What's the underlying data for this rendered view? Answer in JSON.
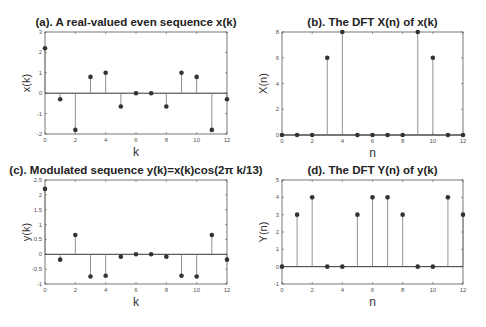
{
  "chart_data": [
    {
      "id": "a",
      "type": "stem",
      "title": "(a). A real-valued even sequence x(k)",
      "xlabel": "k",
      "ylabel": "x(k)",
      "x": [
        0,
        1,
        2,
        3,
        4,
        5,
        6,
        7,
        8,
        9,
        10,
        11,
        12
      ],
      "values": [
        2.2,
        -0.3,
        -1.8,
        0.8,
        1.0,
        -0.65,
        0,
        0,
        -0.65,
        1.0,
        0.8,
        -1.8,
        -0.3
      ],
      "xlim": [
        0,
        12
      ],
      "ylim": [
        -2,
        3
      ],
      "xticks": [
        0,
        2,
        4,
        6,
        8,
        10,
        12
      ],
      "yticks": [
        -2,
        -1,
        0,
        1,
        2,
        3
      ],
      "grid": false,
      "box": {
        "x0": 45,
        "x1": 227,
        "y0": 32,
        "y1": 134
      }
    },
    {
      "id": "b",
      "type": "stem",
      "title": "(b). The DFT X(n) of x(k)",
      "xlabel": "n",
      "ylabel": "X(n)",
      "x": [
        0,
        1,
        2,
        3,
        4,
        5,
        6,
        7,
        8,
        9,
        10,
        11,
        12
      ],
      "values": [
        0,
        0,
        0,
        6,
        8,
        0,
        0,
        0,
        0,
        8,
        6,
        0,
        0
      ],
      "xlim": [
        0,
        12
      ],
      "ylim": [
        0,
        8
      ],
      "xticks": [
        0,
        2,
        4,
        6,
        8,
        10,
        12
      ],
      "yticks": [
        0,
        2,
        4,
        6,
        8
      ],
      "grid": false,
      "box": {
        "x0": 282,
        "x1": 463,
        "y0": 32,
        "y1": 135
      }
    },
    {
      "id": "c",
      "type": "stem",
      "title": "(c). Modulated sequence y(k)=x(k)cos(2π k/13)",
      "xlabel": "k",
      "ylabel": "y(k)",
      "x": [
        0,
        1,
        2,
        3,
        4,
        5,
        6,
        7,
        8,
        9,
        10,
        11,
        12
      ],
      "values": [
        2.2,
        -0.18,
        0.65,
        -0.75,
        -0.72,
        -0.08,
        0,
        0,
        -0.08,
        -0.72,
        -0.75,
        0.65,
        -0.18
      ],
      "xlim": [
        0,
        12
      ],
      "ylim": [
        -1,
        2.5
      ],
      "xticks": [
        0,
        2,
        4,
        6,
        8,
        10,
        12
      ],
      "yticks": [
        -1,
        -0.5,
        0,
        0.5,
        1,
        1.5,
        2,
        2.5
      ],
      "grid": false,
      "box": {
        "x0": 45,
        "x1": 227,
        "y0": 180,
        "y1": 284
      }
    },
    {
      "id": "d",
      "type": "stem",
      "title": "(d). The DFT Y(n) of y(k)",
      "xlabel": "n",
      "ylabel": "Y(n)",
      "x": [
        0,
        1,
        2,
        3,
        4,
        5,
        6,
        7,
        8,
        9,
        10,
        11,
        12
      ],
      "values": [
        0,
        3,
        4,
        0,
        0,
        3,
        4,
        4,
        3,
        0,
        0,
        4,
        3
      ],
      "xlim": [
        0,
        12
      ],
      "ylim": [
        -1,
        5
      ],
      "xticks": [
        0,
        2,
        4,
        6,
        8,
        10,
        12
      ],
      "yticks": [
        -1,
        0,
        1,
        2,
        3,
        4,
        5
      ],
      "grid": false,
      "box": {
        "x0": 282,
        "x1": 463,
        "y0": 180,
        "y1": 284
      }
    }
  ],
  "style": {
    "axis_color": "#555555",
    "stem_color": "#777777",
    "marker_color": "#333333",
    "baseline_color": "#333333"
  }
}
